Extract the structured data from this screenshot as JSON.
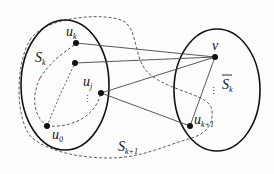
{
  "labels": {
    "u_k": {
      "base": "u",
      "sub": "k"
    },
    "u_j": {
      "base": "u",
      "sub": "j"
    },
    "u_0": {
      "base": "u",
      "sub": "0"
    },
    "u_k1": {
      "base": "u",
      "sub": "k+1"
    },
    "v": {
      "base": "v"
    },
    "S_k": {
      "base": "S",
      "sub": "k"
    },
    "S_k_bar": {
      "base": "S",
      "sub": "k",
      "overline": true
    },
    "S_k1": {
      "base": "S",
      "sub": "k+1"
    },
    "vdots_left": "⋮",
    "vdots_right": "⋮"
  },
  "colors": {
    "stroke": "#111111",
    "dashed": "#333333",
    "edge": "#444444"
  }
}
